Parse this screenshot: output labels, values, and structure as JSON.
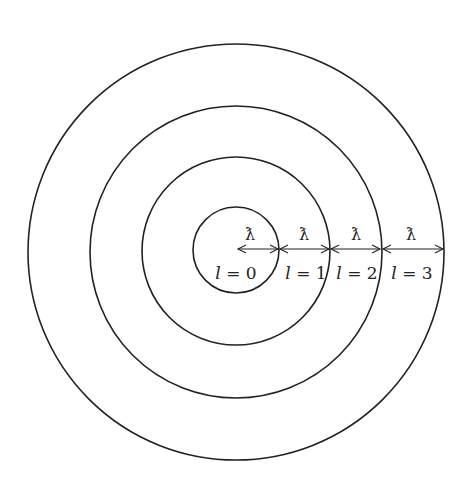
{
  "diagram": {
    "title": "",
    "center": [
      236,
      250
    ],
    "radii": [
      43,
      94,
      145,
      208
    ],
    "stroke_color": "#222222",
    "wavelength_symbol": "ƛ",
    "segments": [
      {
        "label": "l = 0",
        "symbol": "ƛ",
        "l_var": "l",
        "eq": " = ",
        "value": "0"
      },
      {
        "label": "l = 1",
        "symbol": "ƛ",
        "l_var": "l",
        "eq": " = ",
        "value": "1"
      },
      {
        "label": "l = 2",
        "symbol": "ƛ",
        "l_var": "l",
        "eq": " = ",
        "value": "2"
      },
      {
        "label": "l = 3",
        "symbol": "ƛ",
        "l_var": "l",
        "eq": " = ",
        "value": "3"
      }
    ]
  }
}
